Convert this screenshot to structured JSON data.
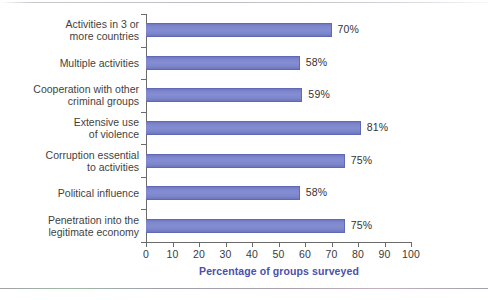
{
  "chart_data": {
    "type": "bar",
    "orientation": "horizontal",
    "title": "",
    "xlabel": "Percentage of groups surveyed",
    "ylabel": "",
    "xlim": [
      0,
      100
    ],
    "xticks": [
      0,
      10,
      20,
      30,
      40,
      50,
      60,
      70,
      80,
      90,
      100
    ],
    "grid": false,
    "legend": null,
    "bar_color": "#7b84cc",
    "bar_edge_color": "#5f69b4",
    "axis_title_color": "#4b51a8",
    "categories": [
      "Activities in 3 or\nmore countries",
      "Multiple activities",
      "Cooperation with other\ncriminal groups",
      "Extensive use\nof violence",
      "Corruption essential\nto activities",
      "Political influence",
      "Penetration into the\nlegitimate economy"
    ],
    "values": [
      70,
      58,
      59,
      81,
      75,
      58,
      75
    ],
    "value_labels": [
      "70%",
      "58%",
      "59%",
      "81%",
      "75%",
      "58%",
      "75%"
    ]
  }
}
